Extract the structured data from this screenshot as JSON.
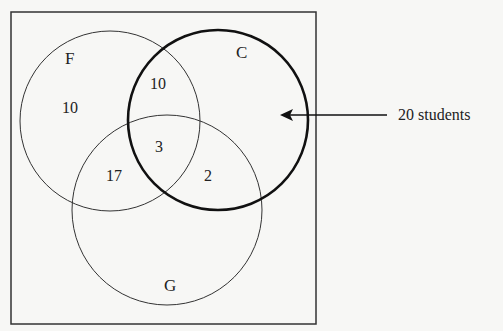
{
  "diagram": {
    "type": "venn",
    "sets": [
      {
        "name": "F",
        "label": "F"
      },
      {
        "name": "C",
        "label": "C",
        "emphasized": true
      },
      {
        "name": "G",
        "label": "G"
      }
    ],
    "regions": {
      "F_only": "10",
      "F_C_only": "10",
      "F_C_G": "3",
      "F_G_only": "17",
      "C_G_only": "2"
    },
    "annotation": {
      "text": "20 students",
      "points_to": "C"
    }
  },
  "colors": {
    "background": "#f7f7f5",
    "stroke": "#222222"
  }
}
